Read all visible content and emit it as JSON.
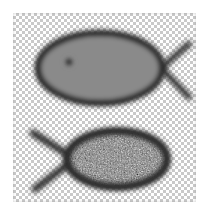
{
  "image": {
    "width": 209,
    "height": 215,
    "background_color": "#ffffff",
    "alt_text": "Two blurred grayscale fish outlines on a transparency checkerboard"
  },
  "canvas": {
    "name": "transparency-canvas",
    "left": 13,
    "top": 13,
    "width": 183,
    "height": 189,
    "checker_light_color": "#ffffff",
    "checker_dark_color": "#c9c9c9",
    "checker_cell_px": 3
  },
  "shapes": [
    {
      "id": "fish-top",
      "label": "Top fish",
      "fill_style": "solid-gray",
      "fill_color": "#8a8a8a",
      "outline_color": "#2b2b2b",
      "outline_width_px": 7,
      "blur_px": 3,
      "facing": "right",
      "body": {
        "cx": 100,
        "cy": 68,
        "rx": 63,
        "ry": 36
      },
      "tail": {
        "x": 163,
        "y": 68,
        "spread_x": 25,
        "spread_y": 32,
        "stroke_width_px": 6
      },
      "eye": {
        "cx": 69,
        "cy": 62,
        "r": 4,
        "color": "#111111",
        "blur_px": 2
      }
    },
    {
      "id": "fish-bottom",
      "label": "Bottom fish",
      "fill_style": "noise-texture",
      "fill_color": "#6e6e6e",
      "noise_light_color": "#e8e8e8",
      "noise_dark_color": "#202020",
      "outline_color": "#2b2b2b",
      "outline_width_px": 8,
      "blur_px": 3,
      "facing": "left",
      "body": {
        "cx": 117,
        "cy": 159,
        "rx": 54,
        "ry": 31
      },
      "tail": {
        "x": 66,
        "y": 159,
        "spread_x": 36,
        "spread_y": 30,
        "stroke_width_px": 7
      }
    }
  ],
  "palette": {
    "ink": "#2b2b2b",
    "body_gray": "#8a8a8a",
    "noise_gray": "#6e6e6e",
    "page_white": "#ffffff",
    "checker_gray": "#c9c9c9"
  }
}
